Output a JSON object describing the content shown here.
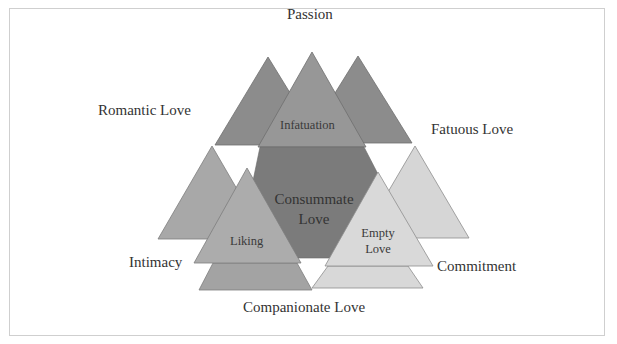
{
  "diagram": {
    "type": "triangular-theory-of-love",
    "outer_labels": {
      "passion": "Passion",
      "romantic_love": "Romantic Love",
      "fatuous_love": "Fatuous Love",
      "intimacy": "Intimacy",
      "commitment": "Commitment",
      "companionate_love": "Companionate Love"
    },
    "inner_labels": {
      "infatuation": "Infatuation",
      "consummate_line1": "Consummate",
      "consummate_line2": "Love",
      "liking": "Liking",
      "empty_line1": "Empty",
      "empty_line2": "Love"
    },
    "colors": {
      "passion_dark": "#8c8c8c",
      "infatuation": "#979797",
      "consummate": "#7b7b7b",
      "intimacy": "#a8a8a8",
      "commitment": "#d6d6d6",
      "edge": "#6e6e6e",
      "text": "#333333",
      "frame": "#cfcfcf"
    }
  }
}
